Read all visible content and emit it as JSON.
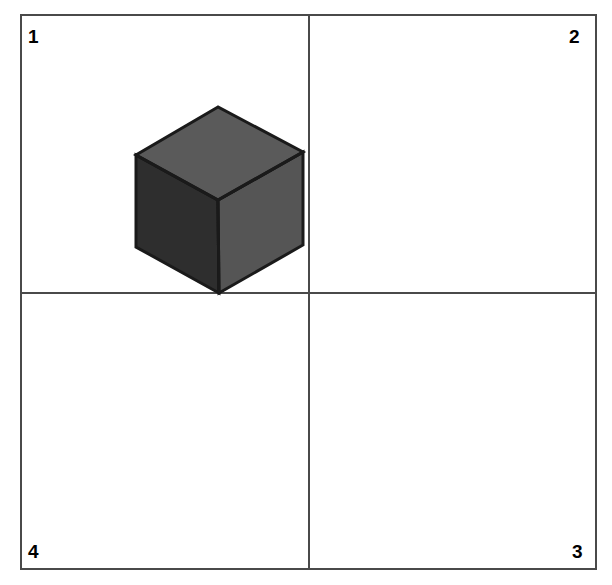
{
  "canvas": {
    "width": 612,
    "height": 585,
    "background": "#ffffff"
  },
  "frame": {
    "border_color": "#4a4a4a",
    "border_width": 2,
    "left": 20,
    "top": 14,
    "width": 577,
    "height": 556
  },
  "dividers": {
    "vertical_x": 308,
    "horizontal_y": 292,
    "color": "#4a4a4a",
    "thickness": 2
  },
  "quadrants": [
    {
      "id": "top-left",
      "label": "1"
    },
    {
      "id": "top-right",
      "label": "2"
    },
    {
      "id": "bottom-right",
      "label": "3"
    },
    {
      "id": "bottom-left",
      "label": "4"
    }
  ],
  "cube": {
    "description": "isometric cube",
    "located_in_quadrant": "1",
    "vertices": {
      "top": [
        218,
        107
      ],
      "upper_left": [
        136,
        155
      ],
      "upper_right": [
        303,
        152
      ],
      "center": [
        218,
        200
      ],
      "lower_left": [
        136,
        247
      ],
      "lower_right": [
        303,
        245
      ],
      "bottom": [
        219,
        293
      ]
    },
    "faces": {
      "top": {
        "color": "#5a5a5a",
        "points": "218,107 136,155 218,200 303,152"
      },
      "left": {
        "color": "#2e2e2e",
        "points": "136,155 136,247 219,293 218,200"
      },
      "right": {
        "color": "#555555",
        "points": "218,200 219,293 303,245 303,152"
      }
    },
    "outline_color": "#1a1a1a",
    "outline_width": 3
  }
}
